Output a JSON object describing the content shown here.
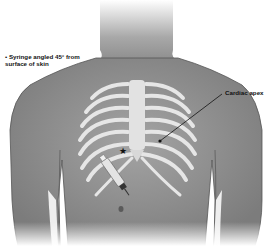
{
  "figure": {
    "labels": {
      "syringe": "• Syringe angled 45° from surface of skin",
      "apex": "Cardiac apex"
    },
    "marker": "star",
    "colors": {
      "skin": "#9a9a9a",
      "skin_dark": "#6e6e6e",
      "bone": "#e6e6e6",
      "line": "#111111",
      "background": "#ffffff"
    }
  }
}
